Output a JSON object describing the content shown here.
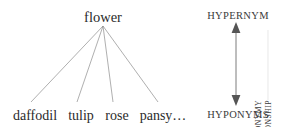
{
  "canvas": {
    "width": 283,
    "height": 127,
    "background": "#ffffff",
    "ink": "#2b2b2b",
    "line_color": "#8c8c8c"
  },
  "diagram": {
    "type": "hyponymy-tree",
    "hypernym": {
      "label": "flower",
      "x": 103,
      "y": 17
    },
    "hyponyms": [
      {
        "label": "daffodil",
        "x": 35,
        "y": 116,
        "edge_end_x": 31
      },
      {
        "label": "tulip",
        "x": 81,
        "y": 116,
        "edge_end_x": 77
      },
      {
        "label": "rose",
        "x": 117,
        "y": 116,
        "edge_end_x": 113
      },
      {
        "label": "pansy…",
        "x": 163,
        "y": 116,
        "edge_end_x": 158
      }
    ],
    "edge_origin": {
      "x": 103,
      "y": 26
    }
  },
  "annotation": {
    "top_label": "HYPERNYM",
    "bottom_label": "HYPONYMS",
    "arrow": {
      "name": "double-headed-vertical-arrow",
      "x": 236,
      "top_y": 24,
      "bottom_y": 104
    },
    "vertical_text": {
      "line_1": "RELATIONSHIP",
      "line_2": "OF HYPONYMY"
    }
  },
  "colors": {
    "ink": "#2b2b2b",
    "muted_ink": "#3a3a3a",
    "edge": "#8c8c8c",
    "arrow": "#555555"
  }
}
